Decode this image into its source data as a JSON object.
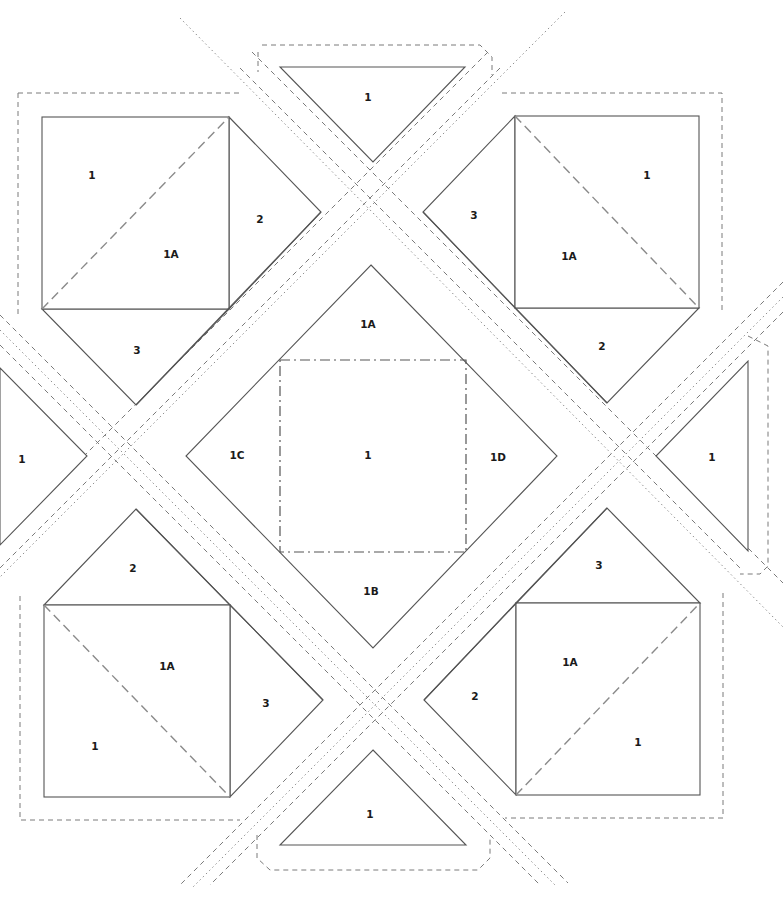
{
  "diagram": {
    "type": "foundation-paper-piecing-pattern",
    "center_block": {
      "labels": {
        "center": "1",
        "top": "1A",
        "bottom": "1B",
        "left": "1C",
        "right": "1D"
      }
    },
    "corner_blocks": {
      "top_left": {
        "labels": {
          "square_a": "1",
          "square_b": "1A",
          "side": "2",
          "bottom": "3"
        }
      },
      "top_right": {
        "labels": {
          "square_a": "1",
          "square_b": "1A",
          "side": "3",
          "bottom": "2"
        }
      },
      "bottom_left": {
        "labels": {
          "square_a": "1",
          "square_b": "1A",
          "top": "2",
          "side": "3"
        }
      },
      "bottom_right": {
        "labels": {
          "square_a": "1",
          "square_b": "1A",
          "top": "3",
          "side": "2"
        }
      }
    },
    "edge_triangles": {
      "top": {
        "label": "1"
      },
      "bottom": {
        "label": "1"
      },
      "left": {
        "label": "1"
      },
      "right": {
        "label": "1"
      }
    },
    "line_styles": {
      "seam": "solid",
      "diagonal_fold": "dashed",
      "cut_line": "dashed",
      "center_line": "dotted",
      "center_square": "dash-dot"
    },
    "colors": {
      "line": "#555555",
      "dash": "#8a8a8a",
      "background": "#ffffff"
    }
  }
}
